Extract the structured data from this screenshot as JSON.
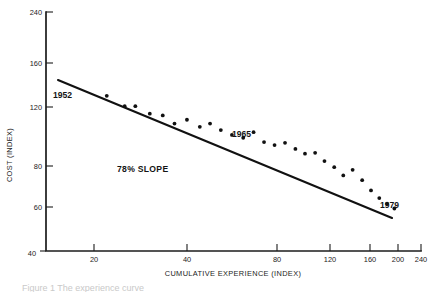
{
  "figure": {
    "background_color": "#ffffff",
    "ink_color": "#111111",
    "caption_clipped": "Figure 1 The experience curve"
  },
  "chart_data": {
    "type": "scatter",
    "title": "",
    "xlabel": "CUMULATIVE EXPERIENCE (INDEX)",
    "ylabel": "COST (INDEX)",
    "xscale": "log",
    "yscale": "log",
    "xlim": [
      12,
      240
    ],
    "ylim": [
      40,
      240
    ],
    "grid": false,
    "legend": false,
    "xticks": [
      20,
      40,
      80,
      120,
      160,
      200,
      240
    ],
    "xticklabels": [
      "20",
      "40",
      "80",
      "120",
      "160",
      "200",
      "240"
    ],
    "yticks": [
      40,
      60,
      80,
      120,
      160,
      240
    ],
    "yticklabels": [
      "40",
      "60",
      "80",
      "120",
      "160",
      "240"
    ],
    "series": [
      {
        "name": "observations",
        "marker": "dot",
        "x": [
          19.5,
          22.5,
          24.5,
          27.5,
          30.5,
          33.5,
          37.0,
          41.0,
          44.5,
          48.5,
          53.0,
          58.0,
          63.0,
          68.5,
          74.5,
          81.0,
          88.0,
          95.0,
          103.0,
          111.0,
          120.0,
          129.0,
          139.0,
          150.0,
          161.0,
          172.0,
          183.0,
          194.0
        ],
        "y": [
          128.0,
          118.5,
          118.5,
          112.0,
          110.5,
          104.0,
          107.0,
          101.5,
          104.0,
          99.0,
          95.5,
          93.5,
          97.5,
          90.5,
          88.5,
          90.0,
          86.0,
          83.0,
          83.5,
          78.5,
          75.0,
          70.5,
          73.5,
          68.0,
          63.0,
          59.5,
          57.0,
          55.0
        ]
      }
    ],
    "fit_line": {
      "name": "78% experience curve",
      "slope_label": "78% SLOPE",
      "x": [
        13.5,
        196.0
      ],
      "y": [
        145.0,
        54.0
      ]
    },
    "annotations": [
      {
        "text": "1952",
        "x": 15.5,
        "y": 118.0
      },
      {
        "text": "1965",
        "x": 62.0,
        "y": 93.0
      },
      {
        "text": "1979",
        "x": 176.0,
        "y": 63.5
      },
      {
        "text": "78% SLOPE",
        "x": 33.0,
        "y": 73.0
      }
    ]
  }
}
